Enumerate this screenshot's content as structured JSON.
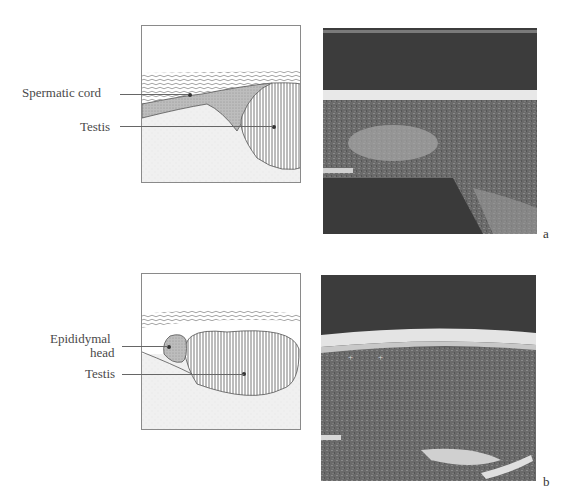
{
  "figure": {
    "panels": [
      {
        "id": "a",
        "letter": "a",
        "labels": {
          "spermatic_cord": "Spermatic cord",
          "testis": "Testis"
        }
      },
      {
        "id": "b",
        "letter": "b",
        "labels": {
          "epididymal_head_line1": "Epididymal",
          "epididymal_head_line2": "head",
          "testis": "Testis"
        }
      }
    ]
  }
}
